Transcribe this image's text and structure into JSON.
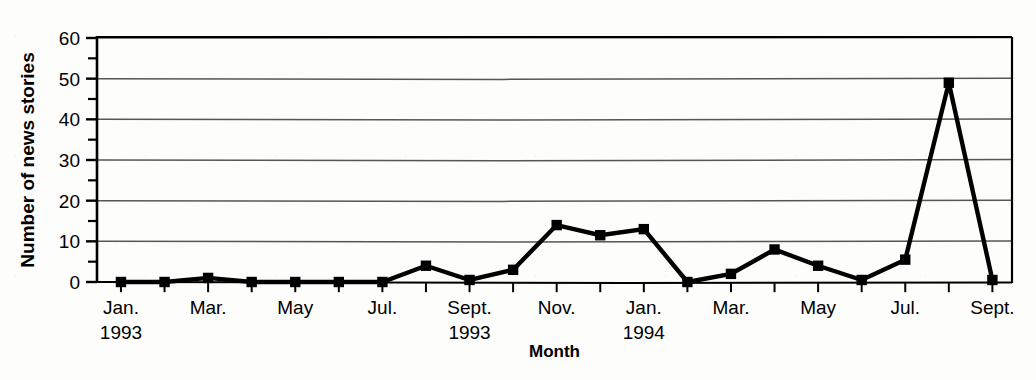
{
  "figure": {
    "background_color": "#fdfdfb",
    "ink_color": "#000000",
    "gridline_color": "#444444"
  },
  "chart_data": {
    "type": "line",
    "title": "",
    "xlabel": "Month",
    "ylabel": "Number of news stories",
    "ylim": [
      0,
      60
    ],
    "y_major_ticks": [
      0,
      10,
      20,
      30,
      40,
      50,
      60
    ],
    "y_minor_ticks": [
      5,
      15,
      25,
      35,
      45,
      55
    ],
    "grid": true,
    "grid_axis": "y",
    "legend": "none",
    "marker": "square",
    "x": [
      "Jan. 1993",
      "Feb. 1993",
      "Mar. 1993",
      "Apr. 1993",
      "May 1993",
      "Jun. 1993",
      "Jul. 1993",
      "Aug. 1993",
      "Sept. 1993",
      "Oct. 1993",
      "Nov. 1993",
      "Dec. 1993",
      "Jan. 1994",
      "Feb. 1994",
      "Mar. 1994",
      "Apr. 1994",
      "May 1994",
      "Jun. 1994",
      "Jul. 1994",
      "Aug. 1994",
      "Sept. 1994"
    ],
    "values": [
      0,
      0,
      1,
      0,
      0,
      0,
      0,
      4,
      0.5,
      3,
      14,
      11.5,
      13,
      0,
      2,
      8,
      4,
      0.5,
      5.5,
      49,
      0.5
    ],
    "x_tick_labels": [
      {
        "index": 0,
        "label": "Jan.",
        "year": "1993"
      },
      {
        "index": 2,
        "label": "Mar.",
        "year": ""
      },
      {
        "index": 4,
        "label": "May",
        "year": ""
      },
      {
        "index": 6,
        "label": "Jul.",
        "year": ""
      },
      {
        "index": 8,
        "label": "Sept.",
        "year": "1993"
      },
      {
        "index": 10,
        "label": "Nov.",
        "year": ""
      },
      {
        "index": 12,
        "label": "Jan.",
        "year": "1994"
      },
      {
        "index": 14,
        "label": "Mar.",
        "year": ""
      },
      {
        "index": 16,
        "label": "May",
        "year": ""
      },
      {
        "index": 18,
        "label": "Jul.",
        "year": ""
      },
      {
        "index": 20,
        "label": "Sept.",
        "year": ""
      }
    ],
    "y_tick_labels": [
      "0",
      "10",
      "20",
      "30",
      "40",
      "50",
      "60"
    ]
  },
  "axes": {
    "y_axis_title": "Number of news stories",
    "x_axis_title": "Month",
    "year_labels": [
      "1993",
      "1994"
    ]
  }
}
